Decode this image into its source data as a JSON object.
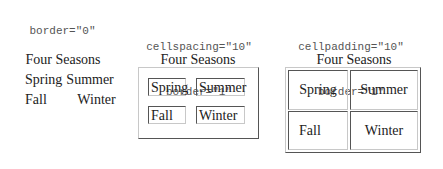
{
  "examples": [
    {
      "attributes": [
        "border=\"0\""
      ],
      "caption": "Four Seasons",
      "cells": [
        [
          "Spring",
          "Summer"
        ],
        [
          "Fall",
          "Winter"
        ]
      ]
    },
    {
      "attributes": [
        "cellspacing=\"10\"",
        "border=\"1\""
      ],
      "caption": "Four Seasons",
      "cells": [
        [
          "Spring",
          "Summer"
        ],
        [
          "Fall",
          "Winter"
        ]
      ]
    },
    {
      "attributes": [
        "cellpadding=\"10\"",
        "border=\"1\""
      ],
      "caption": "Four Seasons",
      "cells": [
        [
          "Spring",
          "Summer"
        ],
        [
          "Fall",
          "Winter"
        ]
      ]
    }
  ]
}
